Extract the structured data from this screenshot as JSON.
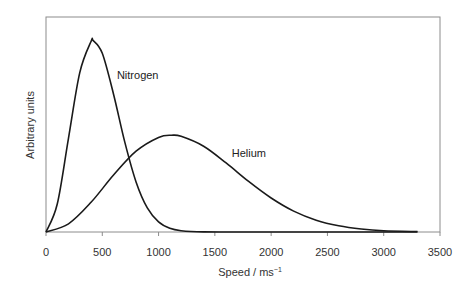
{
  "chart_data": {
    "type": "line",
    "title": "",
    "xlabel": "Speed / ms",
    "xlabel_superscript": "−1",
    "ylabel": "Arbitrary units",
    "xlim": [
      0,
      3500
    ],
    "ylim": [
      0,
      100
    ],
    "x_ticks": [
      0,
      500,
      1000,
      1500,
      2000,
      2500,
      3000,
      3500
    ],
    "x_tick_labels": [
      "0",
      "500",
      "1000",
      "1500",
      "2000",
      "2500",
      "3000",
      "3500"
    ],
    "y_ticks": [],
    "grid": false,
    "legend": "none (inline curve labels)",
    "series": [
      {
        "name": "Nitrogen",
        "label_position": {
          "x": 630,
          "y": 71
        },
        "x": [
          0,
          100,
          200,
          300,
          400,
          420,
          500,
          600,
          700,
          800,
          900,
          1000,
          1100,
          1200,
          1400,
          1700,
          2000,
          2500,
          3000,
          3300
        ],
        "values": [
          0,
          13.0,
          43.7,
          74.1,
          88.6,
          89.0,
          83.1,
          64.1,
          41.8,
          23.3,
          11.2,
          4.7,
          1.7,
          0.6,
          0.04,
          0,
          0,
          0,
          0,
          0
        ]
      },
      {
        "name": "Helium",
        "label_position": {
          "x": 1650,
          "y": 35
        },
        "x": [
          0,
          200,
          400,
          600,
          800,
          1000,
          1115,
          1200,
          1400,
          1600,
          1800,
          2000,
          2200,
          2400,
          2600,
          2800,
          3000,
          3300
        ],
        "values": [
          0,
          3.8,
          13.8,
          26.5,
          37.6,
          44.0,
          45.0,
          44.5,
          39.9,
          32.1,
          23.5,
          15.8,
          9.7,
          5.5,
          2.9,
          1.4,
          0.6,
          0.2
        ]
      }
    ]
  }
}
